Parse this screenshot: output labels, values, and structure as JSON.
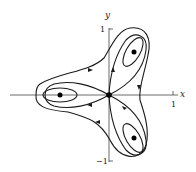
{
  "figure": {
    "type": "phase-portrait",
    "axes": {
      "x_label": "x",
      "y_label": "y",
      "x_tick_pos": "1",
      "y_tick_pos": "1",
      "y_tick_neg": "−1"
    },
    "equilibria": [
      {
        "kind": "saddle",
        "x": 0,
        "y": 0
      },
      {
        "kind": "center",
        "x": -0.75,
        "y": 0
      },
      {
        "kind": "center",
        "x": 0.375,
        "y": 0.65
      },
      {
        "kind": "center",
        "x": 0.375,
        "y": -0.65
      }
    ],
    "colors": {
      "curve": "#1a1a1a",
      "axis": "#333333",
      "point": "#000000"
    }
  }
}
